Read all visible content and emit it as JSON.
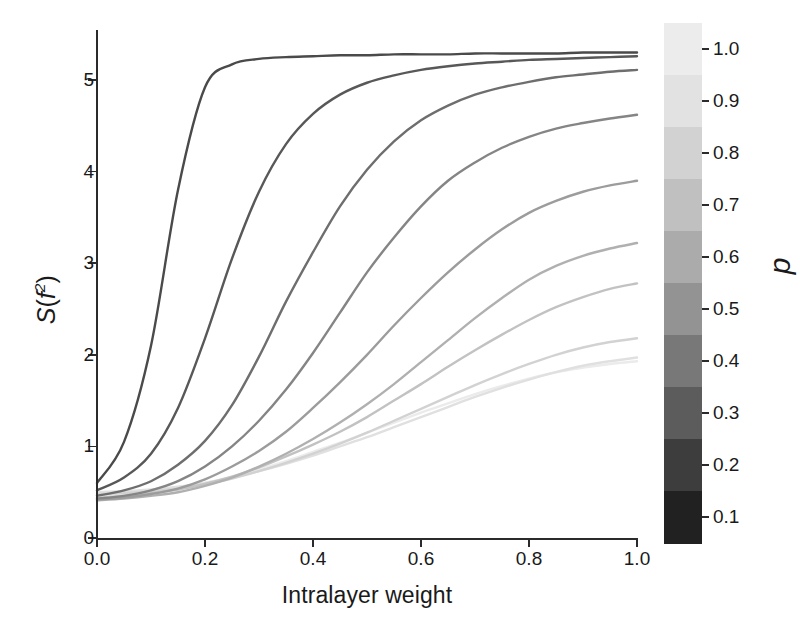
{
  "figure": {
    "background_color": "#ffffff",
    "axis_color": "#2b2b2b"
  },
  "chart_data": {
    "type": "line",
    "title": "",
    "xlabel": "Intralayer weight",
    "ylabel": "S(f2)",
    "ylabel_parts": {
      "fn": "S",
      "open": "(",
      "var": "f",
      "exp": "2",
      "close": ")"
    },
    "xlim": [
      0.0,
      1.0
    ],
    "ylim": [
      0.0,
      5.5
    ],
    "xticks": [
      0.0,
      0.2,
      0.4,
      0.6,
      0.8,
      1.0
    ],
    "xtick_labels": [
      "0.0",
      "0.2",
      "0.4",
      "0.6",
      "0.8",
      "1.0"
    ],
    "yticks": [
      0,
      1,
      2,
      3,
      4,
      5
    ],
    "ytick_labels": [
      "0",
      "1",
      "2",
      "3",
      "4",
      "5"
    ],
    "grid": false,
    "legend": "colorbar-right",
    "colorbar": {
      "label": "p",
      "orientation": "vertical",
      "discrete": true,
      "ticks": [
        1.0,
        0.9,
        0.8,
        0.7,
        0.6,
        0.5,
        0.4,
        0.3,
        0.2,
        0.1
      ],
      "tick_labels": [
        "1.0",
        "0.9",
        "0.8",
        "0.7",
        "0.6",
        "0.5",
        "0.4",
        "0.3",
        "0.2",
        "0.1"
      ],
      "band_colors_top_to_bottom": [
        "#ececec",
        "#e2e2e2",
        "#d2d2d2",
        "#c0c0c0",
        "#ababab",
        "#939393",
        "#787878",
        "#5c5c5c",
        "#3d3d3d",
        "#212121"
      ]
    },
    "x": [
      0.0,
      0.05,
      0.1,
      0.15,
      0.2,
      0.25,
      0.3,
      0.35,
      0.4,
      0.45,
      0.5,
      0.55,
      0.6,
      0.65,
      0.7,
      0.75,
      0.8,
      0.85,
      0.9,
      0.95,
      1.0
    ],
    "series": [
      {
        "name": "p = 0.1",
        "p": 0.1,
        "color": "#4a4a4a",
        "values": [
          0.6,
          1.05,
          2.1,
          3.8,
          4.92,
          5.17,
          5.23,
          5.25,
          5.26,
          5.27,
          5.27,
          5.28,
          5.28,
          5.28,
          5.29,
          5.29,
          5.29,
          5.29,
          5.3,
          5.3,
          5.3
        ]
      },
      {
        "name": "p = 0.2",
        "p": 0.2,
        "color": "#585858",
        "values": [
          0.52,
          0.66,
          0.92,
          1.42,
          2.18,
          3.05,
          3.78,
          4.3,
          4.63,
          4.84,
          4.97,
          5.05,
          5.11,
          5.15,
          5.18,
          5.2,
          5.22,
          5.23,
          5.24,
          5.25,
          5.26
        ]
      },
      {
        "name": "p = 0.3",
        "p": 0.3,
        "color": "#6e6e6e",
        "values": [
          0.46,
          0.52,
          0.62,
          0.8,
          1.06,
          1.45,
          1.98,
          2.58,
          3.12,
          3.62,
          4.02,
          4.33,
          4.56,
          4.72,
          4.84,
          4.92,
          4.98,
          5.03,
          5.06,
          5.09,
          5.11
        ]
      },
      {
        "name": "p = 0.4",
        "p": 0.4,
        "color": "#858585",
        "values": [
          0.43,
          0.46,
          0.52,
          0.62,
          0.78,
          1.0,
          1.28,
          1.62,
          2.02,
          2.46,
          2.9,
          3.28,
          3.62,
          3.9,
          4.1,
          4.26,
          4.38,
          4.47,
          4.53,
          4.58,
          4.62
        ]
      },
      {
        "name": "p = 0.5",
        "p": 0.5,
        "color": "#9c9c9c",
        "values": [
          0.42,
          0.44,
          0.48,
          0.54,
          0.64,
          0.78,
          0.95,
          1.16,
          1.42,
          1.7,
          2.0,
          2.32,
          2.62,
          2.9,
          3.15,
          3.37,
          3.55,
          3.68,
          3.78,
          3.85,
          3.9
        ]
      },
      {
        "name": "p = 0.6",
        "p": 0.6,
        "color": "#b0b0b0",
        "values": [
          0.41,
          0.43,
          0.46,
          0.5,
          0.57,
          0.66,
          0.78,
          0.92,
          1.08,
          1.26,
          1.46,
          1.68,
          1.92,
          2.16,
          2.4,
          2.62,
          2.82,
          2.97,
          3.08,
          3.16,
          3.22
        ]
      },
      {
        "name": "p = 0.7",
        "p": 0.7,
        "color": "#c2c2c2",
        "values": [
          0.44,
          0.46,
          0.49,
          0.53,
          0.59,
          0.67,
          0.77,
          0.89,
          1.02,
          1.16,
          1.32,
          1.5,
          1.68,
          1.87,
          2.05,
          2.22,
          2.38,
          2.52,
          2.63,
          2.72,
          2.78
        ]
      },
      {
        "name": "p = 0.8",
        "p": 0.8,
        "color": "#d2d2d2",
        "values": [
          0.48,
          0.49,
          0.51,
          0.54,
          0.59,
          0.65,
          0.73,
          0.82,
          0.92,
          1.03,
          1.15,
          1.28,
          1.41,
          1.54,
          1.67,
          1.79,
          1.9,
          2.0,
          2.08,
          2.14,
          2.18
        ]
      },
      {
        "name": "p = 0.9",
        "p": 0.9,
        "color": "#e0e0e0",
        "values": [
          0.5,
          0.51,
          0.53,
          0.56,
          0.6,
          0.66,
          0.73,
          0.81,
          0.9,
          1.0,
          1.1,
          1.21,
          1.32,
          1.43,
          1.54,
          1.64,
          1.73,
          1.81,
          1.88,
          1.93,
          1.97
        ]
      },
      {
        "name": "p = 1.0",
        "p": 1.0,
        "color": "#ebebeb",
        "values": [
          0.46,
          0.48,
          0.51,
          0.55,
          0.6,
          0.67,
          0.75,
          0.84,
          0.94,
          1.04,
          1.15,
          1.26,
          1.37,
          1.47,
          1.57,
          1.66,
          1.74,
          1.81,
          1.86,
          1.9,
          1.93
        ]
      }
    ]
  }
}
